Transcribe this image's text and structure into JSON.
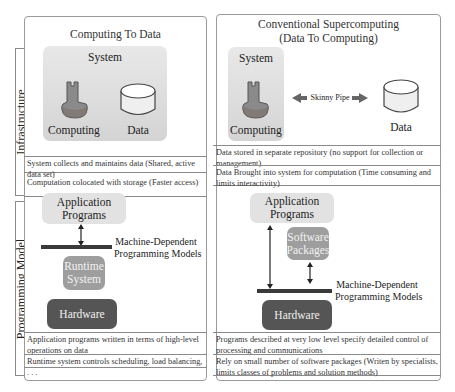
{
  "sections": {
    "infrastructure_label": "Infrastructure",
    "programming_model_label": "Programming Model"
  },
  "left": {
    "title": "Computing To Data",
    "system_label": "System",
    "computing_label": "Computing",
    "data_label": "Data",
    "infra_rows": [
      "System collects and maintains data (Shared, active data set)",
      "Computation colocated with storage (Faster access)"
    ],
    "prog": {
      "app_label_1": "Application",
      "app_label_2": "Programs",
      "mdpm_1": "Machine-Dependent",
      "mdpm_2": "Programming Models",
      "runtime_1": "Runtime",
      "runtime_2": "System",
      "hardware": "Hardware"
    },
    "prog_rows": [
      "Application programs written in terms of high-level operations on data",
      "Runtime system controls scheduling, load balancing, . . ."
    ]
  },
  "right": {
    "title_1": "Conventional Supercomputing",
    "title_2": "(Data To Computing)",
    "system_label": "System",
    "computing_label": "Computing",
    "pipe_label": "Skinny Pipe",
    "data_label": "Data",
    "infra_rows": [
      "Data stored in separate repository (no support for collection or management)",
      "Data Brought into system for computation (Time consuming and limits interactivity)"
    ],
    "prog": {
      "app_label_1": "Application",
      "app_label_2": "Programs",
      "software_1": "Software",
      "software_2": "Packages",
      "mdpm_1": "Machine-Dependent",
      "mdpm_2": "Programming Models",
      "hardware": "Hardware"
    },
    "prog_rows": [
      "Programs described at very low level specify detailed control of processing and communications",
      "Rely on small number of software packages (Writen by specialists, limits classes of problems and solution methods)"
    ]
  },
  "colors": {
    "computing_icon": "#8a8a8a",
    "system_bg": "#dcdcdc",
    "app_box": "#e2e2e2",
    "runtime_box": "#9e9e9e",
    "hardware_box": "#555555",
    "bar": "#3a3a3a"
  }
}
